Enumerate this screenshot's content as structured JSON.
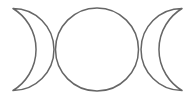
{
  "symbol": {
    "name": "triple-moon",
    "stroke_color": "#666666",
    "background_color": "#ffffff",
    "parts": [
      "waxing-crescent",
      "full-moon",
      "waning-crescent"
    ]
  }
}
